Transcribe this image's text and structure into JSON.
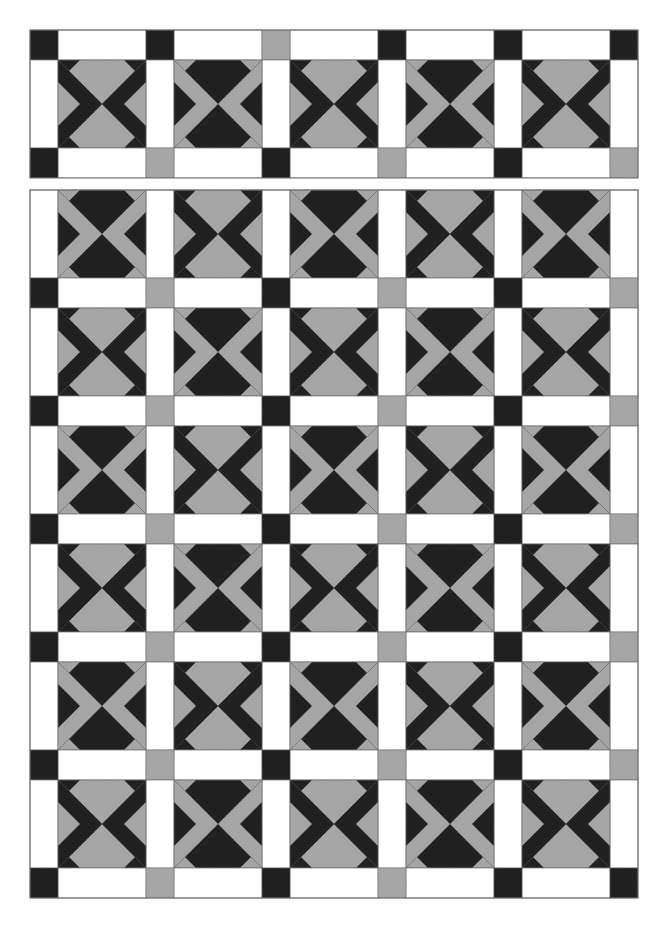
{
  "artwork": {
    "title": "Pinwheel X-Block Quilt Layout",
    "kind": "quilt-pattern-diagram",
    "background_color": "#ffffff"
  },
  "palette": {
    "dark": "#1e1e1e",
    "gray": "#a8a8a8",
    "white": "#ffffff",
    "seam_line": "#555555",
    "border_line": "#6b6b6b"
  },
  "geometry": {
    "canvas_width": 669,
    "canvas_height": 942,
    "panel_left": 30,
    "panel_right": 638,
    "sash_thickness": 30,
    "block_size": 88,
    "columns": 5,
    "top_panel_rows": 1,
    "main_panel_rows": 6
  },
  "sashing_rows": {
    "top": {
      "label": "top-sashing-row",
      "y": 30,
      "cornerstones": [
        "dark",
        "dark",
        "gray",
        "dark",
        "dark",
        "dark"
      ],
      "strips": [
        "white",
        "white",
        "white",
        "white",
        "white"
      ]
    },
    "middle": {
      "label": "middle-sashing-row",
      "y": 170,
      "cornerstones": [
        "dark",
        "gray",
        "dark",
        "gray",
        "dark",
        "gray"
      ],
      "strips": [
        "white",
        "white",
        "white",
        "white",
        "white"
      ]
    },
    "inner": {
      "label": "inner-sashing-row",
      "cornerstones": [
        "dark",
        "gray",
        "dark",
        "gray",
        "dark",
        "gray"
      ],
      "strips": [
        "white",
        "white",
        "white",
        "white",
        "white"
      ]
    },
    "bottom": {
      "label": "bottom-sashing-row",
      "cornerstones": [
        "dark",
        "gray",
        "dark",
        "gray",
        "dark",
        "dark"
      ],
      "strips": [
        "white",
        "white",
        "white",
        "white",
        "white"
      ]
    }
  },
  "top_panel": {
    "label": "top-block-band",
    "y": 70,
    "rows": [
      {
        "index": 0,
        "blocks": [
          "dark",
          "gray",
          "dark",
          "gray",
          "dark"
        ]
      }
    ]
  },
  "main_panel": {
    "label": "main-block-field",
    "y": 210,
    "rows": [
      {
        "index": 0,
        "blocks": [
          "gray",
          "dark",
          "gray",
          "dark",
          "gray"
        ]
      },
      {
        "index": 1,
        "blocks": [
          "dark",
          "gray",
          "dark",
          "gray",
          "dark"
        ]
      },
      {
        "index": 2,
        "blocks": [
          "gray",
          "dark",
          "gray",
          "dark",
          "gray"
        ]
      },
      {
        "index": 3,
        "blocks": [
          "dark",
          "gray",
          "dark",
          "gray",
          "dark"
        ]
      },
      {
        "index": 4,
        "blocks": [
          "gray",
          "dark",
          "gray",
          "dark",
          "gray"
        ]
      },
      {
        "index": 5,
        "blocks": [
          "dark",
          "gray",
          "dark",
          "gray",
          "dark"
        ]
      }
    ]
  },
  "block_legend": {
    "dark_block_name": "dark-x-pinwheel-block",
    "gray_block_name": "gray-x-pinwheel-block",
    "dark_block_desc": "Dark X over gray field with dark corner triangles",
    "gray_block_desc": "Gray X over dark field with gray corner triangles"
  }
}
